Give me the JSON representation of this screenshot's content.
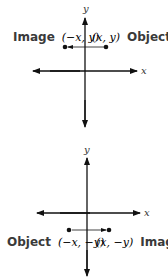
{
  "diagrams": [
    {
      "name": "reflection-across-y-axis",
      "axis_labels": {
        "x": "x",
        "y": "y"
      },
      "left_label": {
        "word": "Image",
        "coords": "(−x, y)"
      },
      "right_label": {
        "coords": "(x, y)",
        "word": "Object"
      },
      "object_point": "(x, y)",
      "image_point": "(−x, y)",
      "arrow_direction": "left"
    },
    {
      "name": "reflection-across-y-axis-below",
      "axis_labels": {
        "x": "x",
        "y": "y"
      },
      "left_label": {
        "word": "Object",
        "coords": "(−x, −y)"
      },
      "right_label": {
        "coords": "(x, −y)",
        "word": "Image"
      },
      "object_point": "(−x, −y)",
      "image_point": "(x, −y)",
      "arrow_direction": "right"
    }
  ],
  "colors": {
    "ink": "#111111",
    "label": "#3a3a3a"
  }
}
